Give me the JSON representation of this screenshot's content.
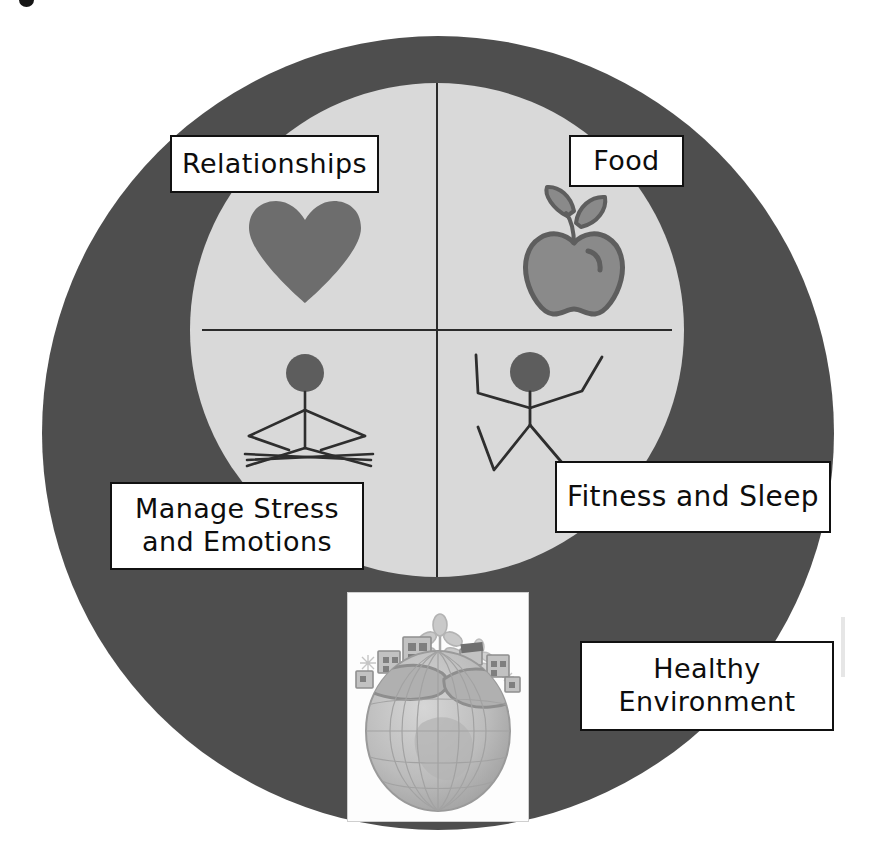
{
  "diagram": {
    "type": "wheel-quadrant-diagram",
    "colors": {
      "outer_ring": "#4e4e4e",
      "inner_disc": "#d9d9d9",
      "divider": "#2b2b2b",
      "icon_fill": "#6e6e6e",
      "label_background": "#ffffff",
      "label_border": "#111111",
      "text": "#0d0d0d"
    },
    "quadrants": [
      {
        "position": "top-left",
        "label": "Relationships",
        "icon": "heart-icon"
      },
      {
        "position": "top-right",
        "label": "Food",
        "icon": "apple-icon"
      },
      {
        "position": "bottom-left",
        "label": "Manage Stress\nand Emotions",
        "icon": "figure-stressed-icon"
      },
      {
        "position": "bottom-right",
        "label": "Fitness and Sleep",
        "icon": "figure-active-icon"
      }
    ],
    "outer_ring_item": {
      "position": "bottom-center",
      "label": "Healthy\nEnvironment",
      "icon": "globe-photo-icon",
      "image_description": "globe with buildings and trees"
    }
  }
}
